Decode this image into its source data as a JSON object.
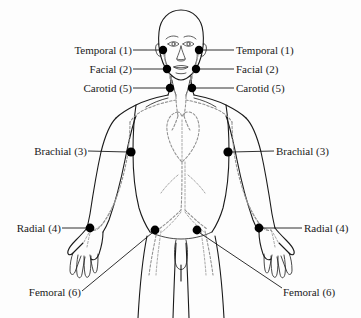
{
  "diagram": {
    "background_color": "#fdfdfd",
    "ink_color": "#1a1a1a",
    "artery_color": "#8a8a8a",
    "point_color": "#000000"
  },
  "labels": {
    "temporal_left": "Temporal (1)",
    "temporal_right": "Temporal (1)",
    "facial_left": "Facial (2)",
    "facial_right": "Facial (2)",
    "carotid_left": "Carotid (5)",
    "carotid_right": "Carotid (5)",
    "brachial_left": "Brachial (3)",
    "brachial_right": "Brachial (3)",
    "radial_left": "Radial (4)",
    "radial_right": "Radial (4)",
    "femoral_left": "Femoral (6)",
    "femoral_right": "Femoral (6)"
  },
  "pressure_points": [
    {
      "name": "temporal",
      "number": 1,
      "side": "left",
      "x": 163,
      "y": 50
    },
    {
      "name": "temporal",
      "number": 1,
      "side": "right",
      "x": 199,
      "y": 50
    },
    {
      "name": "facial",
      "number": 2,
      "side": "left",
      "x": 167,
      "y": 69
    },
    {
      "name": "facial",
      "number": 2,
      "side": "right",
      "x": 196,
      "y": 69
    },
    {
      "name": "carotid",
      "number": 5,
      "side": "left",
      "x": 170,
      "y": 88
    },
    {
      "name": "carotid",
      "number": 5,
      "side": "right",
      "x": 192,
      "y": 88
    },
    {
      "name": "brachial",
      "number": 3,
      "side": "left",
      "x": 131,
      "y": 152
    },
    {
      "name": "brachial",
      "number": 3,
      "side": "right",
      "x": 228,
      "y": 152
    },
    {
      "name": "radial",
      "number": 4,
      "side": "left",
      "x": 90,
      "y": 228
    },
    {
      "name": "radial",
      "number": 4,
      "side": "right",
      "x": 259,
      "y": 228
    },
    {
      "name": "femoral",
      "number": 6,
      "side": "left",
      "x": 155,
      "y": 230
    },
    {
      "name": "femoral",
      "number": 6,
      "side": "right",
      "x": 197,
      "y": 230
    }
  ]
}
